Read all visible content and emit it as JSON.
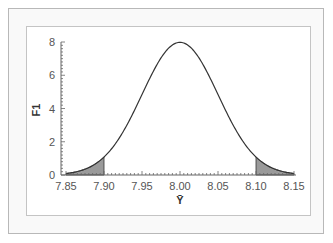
{
  "chart_data": {
    "type": "area",
    "title": "",
    "xlabel": "Ȳ",
    "ylabel": "F1",
    "xlim": [
      7.85,
      8.15
    ],
    "ylim": [
      0,
      8
    ],
    "x_ticks": [
      "7.85",
      "7.90",
      "7.95",
      "8.00",
      "8.05",
      "8.10",
      "8.15"
    ],
    "y_ticks": [
      "0",
      "2",
      "4",
      "6",
      "8"
    ],
    "grid": false,
    "legend": null,
    "distribution": {
      "kind": "normal",
      "mean": 8.0,
      "sd": 0.05
    },
    "series": [
      {
        "name": "density curve",
        "x": [
          7.85,
          7.875,
          7.9,
          7.925,
          7.95,
          7.975,
          8.0,
          8.025,
          8.05,
          8.075,
          8.1,
          8.125,
          8.15
        ],
        "values": [
          0.09,
          0.35,
          1.08,
          2.6,
          4.84,
          7.04,
          7.98,
          7.04,
          4.84,
          2.6,
          1.08,
          0.35,
          0.09
        ]
      }
    ],
    "shaded_regions": [
      {
        "name": "lower tail",
        "from": 7.85,
        "to": 7.9,
        "color": "#9a9a9a"
      },
      {
        "name": "upper tail",
        "from": 8.1,
        "to": 8.15,
        "color": "#9a9a9a"
      }
    ],
    "colors": {
      "curve": "#333333",
      "shade": "#9a9a9a",
      "axis": "#666666"
    }
  }
}
